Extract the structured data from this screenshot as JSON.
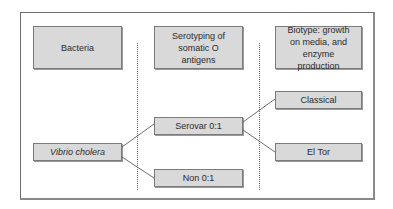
{
  "headers": {
    "bacteria": "Bacteria",
    "serotyping": "Serotyping of somatic O antigens",
    "biotype": "Biotype: growth on media, and enzyme production"
  },
  "nodes": {
    "root": "Vibrio cholera",
    "serovar": "Serovar 0:1",
    "non": "Non 0:1",
    "classical": "Classical",
    "eltor": "El Tor"
  },
  "edges": [
    {
      "from": "Vibrio cholera",
      "to": "Serovar 0:1"
    },
    {
      "from": "Vibrio cholera",
      "to": "Non 0:1"
    },
    {
      "from": "Serovar 0:1",
      "to": "Classical"
    },
    {
      "from": "Serovar 0:1",
      "to": "El Tor"
    }
  ]
}
